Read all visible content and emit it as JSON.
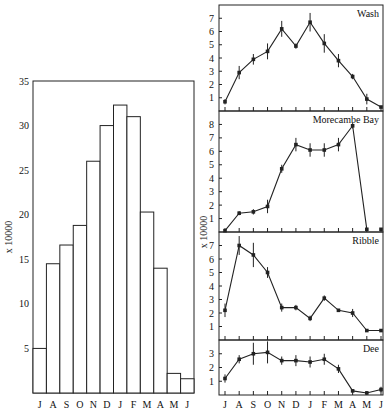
{
  "chart_data": [
    {
      "type": "bar",
      "title": "",
      "xlabel": "",
      "ylabel": "x 10000",
      "ylim": [
        0,
        35
      ],
      "yticks": [
        5,
        10,
        15,
        20,
        25,
        30,
        35
      ],
      "categories": [
        "J",
        "A",
        "S",
        "O",
        "N",
        "D",
        "J",
        "F",
        "M",
        "A",
        "M",
        "J"
      ],
      "values": [
        5,
        14.5,
        16.6,
        18.8,
        26,
        30,
        32.3,
        31,
        20.3,
        14,
        2.2,
        1.6
      ],
      "grid": false
    },
    {
      "type": "line",
      "title": "Wash",
      "ylabel": "x 10000",
      "ylim": [
        0,
        8
      ],
      "yticks": [
        1,
        2,
        3,
        4,
        5,
        6,
        7
      ],
      "categories": [
        "J",
        "A",
        "S",
        "O",
        "N",
        "D",
        "J",
        "F",
        "M",
        "A",
        "M",
        "J"
      ],
      "values": [
        0.7,
        2.9,
        3.9,
        4.5,
        6.2,
        4.9,
        6.7,
        5.1,
        3.8,
        2.6,
        0.9,
        0.3
      ],
      "error": [
        0.2,
        0.5,
        0.4,
        0.6,
        0.6,
        0.2,
        0.7,
        0.7,
        0.5,
        0.2,
        0.4,
        0.1
      ]
    },
    {
      "type": "line",
      "title": "Morecambe Bay",
      "ylabel": "x 10000",
      "ylim": [
        0,
        9
      ],
      "yticks": [
        1,
        2,
        3,
        4,
        5,
        6,
        7,
        8
      ],
      "categories": [
        "J",
        "A",
        "S",
        "O",
        "N",
        "D",
        "J",
        "F",
        "M",
        "A",
        "M",
        "J"
      ],
      "values": [
        0.1,
        1.4,
        1.5,
        1.9,
        4.7,
        6.5,
        6.1,
        6.1,
        6.5,
        7.9,
        0.2,
        0.2
      ],
      "error": [
        0.05,
        0.15,
        0.2,
        0.5,
        0.3,
        0.5,
        0.5,
        0.5,
        0.5,
        0.2,
        0.1,
        0.05
      ],
      "note": "last point (J) unconnected"
    },
    {
      "type": "line",
      "title": "Ribble",
      "ylabel": "x 10000",
      "ylim": [
        0,
        8
      ],
      "yticks": [
        1,
        2,
        3,
        4,
        5,
        6,
        7
      ],
      "categories": [
        "J",
        "A",
        "S",
        "O",
        "N",
        "D",
        "J",
        "F",
        "M",
        "A",
        "M",
        "J"
      ],
      "values": [
        2.2,
        7.0,
        6.3,
        5.0,
        2.4,
        2.4,
        1.6,
        3.1,
        2.2,
        2.0,
        0.7,
        0.7
      ],
      "error": [
        0.5,
        0.7,
        0.9,
        0.4,
        0.3,
        0.2,
        0.2,
        0.2,
        0.1,
        0.3,
        0.1,
        0.1
      ]
    },
    {
      "type": "line",
      "title": "Dee",
      "ylabel": "x 10000",
      "ylim": [
        0,
        4
      ],
      "yticks": [
        1,
        2,
        3
      ],
      "categories": [
        "J",
        "A",
        "S",
        "O",
        "N",
        "D",
        "J",
        "F",
        "M",
        "A",
        "M",
        "J"
      ],
      "values": [
        1.2,
        2.6,
        3.0,
        3.1,
        2.5,
        2.5,
        2.4,
        2.6,
        1.9,
        0.3,
        0.15,
        0.4
      ],
      "error": [
        0.3,
        0.3,
        0.8,
        0.8,
        0.3,
        0.4,
        0.4,
        0.4,
        0.3,
        0.1,
        0.1,
        0.2
      ]
    }
  ],
  "left_ylabel": "x 10000",
  "right_ylabel": "x 10000",
  "months": [
    "J",
    "A",
    "S",
    "O",
    "N",
    "D",
    "J",
    "F",
    "M",
    "A",
    "M",
    "J"
  ]
}
